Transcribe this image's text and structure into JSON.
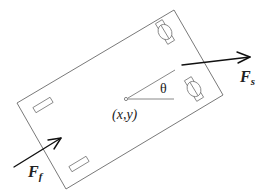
{
  "diagram": {
    "type": "vehicle free-body diagram",
    "labels": {
      "position": "(x,y)",
      "angle": "θ",
      "force_side": {
        "main": "F",
        "sub": "s"
      },
      "force_front": {
        "main": "F",
        "sub": "f"
      }
    },
    "colors": {
      "outline": "#6a6a6a",
      "force_arrow": "#111111",
      "text": "#222222",
      "background": "#ffffff"
    },
    "vehicle_body": {
      "corners": [
        [
          174,
          10
        ],
        [
          223,
          95
        ],
        [
          66,
          189
        ],
        [
          17,
          103
        ]
      ]
    },
    "center_point": [
      126,
      99
    ],
    "front_wheels": [
      {
        "name": "front-top",
        "center": [
          165,
          32
        ]
      },
      {
        "name": "front-bottom",
        "center": [
          194,
          89
        ]
      }
    ],
    "rear_wheels": [
      {
        "name": "rear-top",
        "center": [
          43,
          105
        ]
      },
      {
        "name": "rear-bottom",
        "center": [
          79,
          164
        ]
      }
    ],
    "arrows": {
      "F_s": {
        "from": [
          182,
          65
        ],
        "to": [
          250,
          57
        ]
      },
      "F_f": {
        "from": [
          14,
          167
        ],
        "to": [
          61,
          138
        ]
      }
    }
  }
}
